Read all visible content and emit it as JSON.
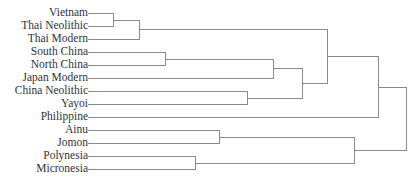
{
  "chart_data": {
    "type": "dendrogram",
    "title": "",
    "leaves": [
      {
        "label": "Vietnam",
        "y": 13
      },
      {
        "label": "Thai Neolithic",
        "y": 26
      },
      {
        "label": "Thai Modern",
        "y": 39
      },
      {
        "label": "South China",
        "y": 52
      },
      {
        "label": "North China",
        "y": 65
      },
      {
        "label": "Japan Modern",
        "y": 78
      },
      {
        "label": "China Neolithic",
        "y": 91
      },
      {
        "label": "Yayoi",
        "y": 104
      },
      {
        "label": "Philippine",
        "y": 117
      },
      {
        "label": "Ainu",
        "y": 130
      },
      {
        "label": "Jomon",
        "y": 143
      },
      {
        "label": "Polynesia",
        "y": 156
      },
      {
        "label": "Micronesia",
        "y": 169
      }
    ],
    "leaf_x": 88,
    "merges": [
      {
        "id": "n1",
        "children": [
          "Vietnam",
          "Thai Neolithic"
        ],
        "x": 113
      },
      {
        "id": "n2",
        "children": [
          "n1",
          "Thai Modern"
        ],
        "x": 139
      },
      {
        "id": "n3",
        "children": [
          "South China",
          "North China"
        ],
        "x": 165
      },
      {
        "id": "n4",
        "children": [
          "Polynesia",
          "Micronesia"
        ],
        "x": 195
      },
      {
        "id": "n5",
        "children": [
          "Ainu",
          "Jomon"
        ],
        "x": 219
      },
      {
        "id": "n6",
        "children": [
          "China Neolithic",
          "Yayoi"
        ],
        "x": 247
      },
      {
        "id": "n7",
        "children": [
          "n3",
          "Japan Modern"
        ],
        "x": 273
      },
      {
        "id": "n8",
        "children": [
          "n7",
          "n6"
        ],
        "x": 302
      },
      {
        "id": "n9",
        "children": [
          "n2",
          "n8"
        ],
        "x": 327
      },
      {
        "id": "n10",
        "children": [
          "n5",
          "n4"
        ],
        "x": 354
      },
      {
        "id": "n11",
        "children": [
          "n9",
          "Philippine"
        ],
        "x": 378
      },
      {
        "id": "n12",
        "children": [
          "n11",
          "n10"
        ],
        "x": 406
      }
    ]
  }
}
